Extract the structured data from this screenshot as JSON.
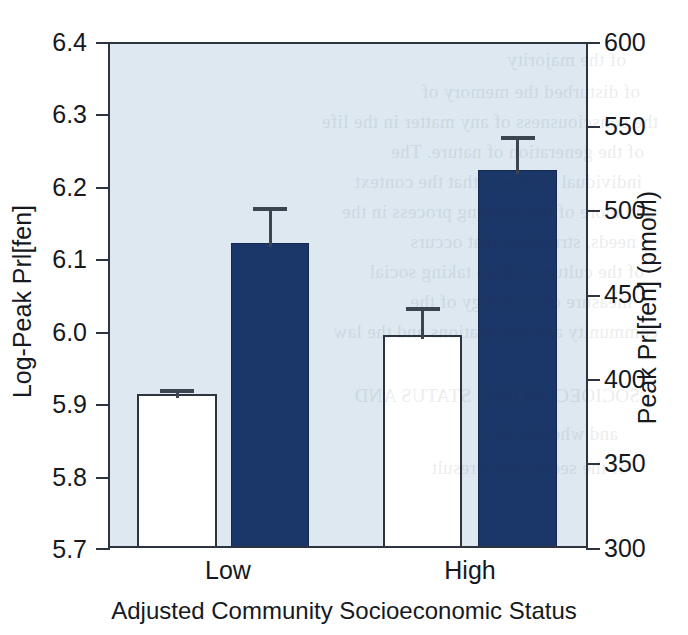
{
  "chart_data": {
    "type": "bar",
    "title": "",
    "xlabel": "Adjusted Community Socioeconomic Status",
    "ylabel": "Log-Peak Prl[fen]",
    "ylabel_right": "Peak Prl[fen] (pmol/l)",
    "categories": [
      "Low",
      "High"
    ],
    "ylim": [
      5.7,
      6.4
    ],
    "ylim_right": [
      300,
      600
    ],
    "yticks": [
      "5.7",
      "5.8",
      "5.9",
      "6.0",
      "6.1",
      "6.2",
      "6.3",
      "6.4"
    ],
    "ytick_values": [
      5.7,
      5.8,
      5.9,
      6.0,
      6.1,
      6.2,
      6.3,
      6.4
    ],
    "yticks_right": [
      "300",
      "350",
      "400",
      "450",
      "500",
      "550",
      "600"
    ],
    "ytick_values_right": [
      300,
      350,
      400,
      450,
      500,
      550,
      600
    ],
    "grid": false,
    "legend": "none",
    "error_type": "standard error",
    "series": [
      {
        "name": "Open bar",
        "color": "#ffffff",
        "values": [
          5.88,
          6.0
        ],
        "errors_upper": [
          5.916,
          6.035
        ]
      },
      {
        "name": "Filled bar",
        "color": "#1b3668",
        "values": [
          6.12,
          6.22
        ],
        "errors_upper": [
          6.172,
          6.26
        ]
      }
    ]
  },
  "axes": {
    "left": {
      "title": "Log-Peak Prl[fen]",
      "ticks": [
        "6.4",
        "6.3",
        "6.2",
        "6.1",
        "6.0",
        "5.9",
        "5.8",
        "5.7"
      ]
    },
    "right": {
      "title": "Peak Prl[fen] (pmol/l)",
      "ticks": [
        "600",
        "550",
        "500",
        "450",
        "400",
        "350",
        "300"
      ]
    },
    "x": {
      "title": "Adjusted Community Socioeconomic Status",
      "categories": [
        "Low",
        "High"
      ]
    }
  },
  "colors": {
    "plot_background": "#dde8f0",
    "frame": "#2d3440",
    "bar_dark": "#1b3668",
    "bar_light": "#ffffff",
    "error_bar": "#3c4450",
    "text": "#16191e",
    "page_background": "#ffffff"
  },
  "bleed_through": [
    {
      "text": "of the majority",
      "x": 62,
      "y": 44
    },
    {
      "text": "of disturbed the memory of",
      "x": 48,
      "y": 76
    },
    {
      "text": "the consciousness of any matter in the life",
      "x": 30,
      "y": 106
    },
    {
      "text": "of the generation of nature. The",
      "x": 44,
      "y": 136
    },
    {
      "text": "individual field was that the context",
      "x": 46,
      "y": 166
    },
    {
      "text": "and more of the growing process in the",
      "x": 34,
      "y": 196
    },
    {
      "text": "needs, structures that occurs",
      "x": 52,
      "y": 226
    },
    {
      "text": "of the culture, whose taking social",
      "x": 44,
      "y": 256
    },
    {
      "text": "measure of sociology of the",
      "x": 56,
      "y": 286
    },
    {
      "text": "community and the relations and the law",
      "x": 30,
      "y": 316
    },
    {
      "text": "SOCIOECONOMIC STATUS AND",
      "x": 48,
      "y": 380
    },
    {
      "text": "and whether the",
      "x": 70,
      "y": 418
    },
    {
      "text": "of the sector and a result",
      "x": 60,
      "y": 452
    }
  ]
}
